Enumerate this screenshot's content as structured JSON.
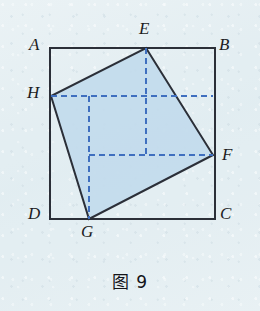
{
  "figure": {
    "caption": "图 9",
    "outer_square": {
      "name": "ABCD",
      "stroke_color": "#2b2f38",
      "stroke_width": 2,
      "vertices": [
        {
          "id": "A",
          "label": "A",
          "x": 50,
          "y": 48,
          "label_x": 29,
          "label_y": 36
        },
        {
          "id": "B",
          "label": "B",
          "x": 215,
          "y": 48,
          "label_x": 219,
          "label_y": 36
        },
        {
          "id": "C",
          "label": "C",
          "x": 215,
          "y": 219,
          "label_x": 220,
          "label_y": 205
        },
        {
          "id": "D",
          "label": "D",
          "x": 50,
          "y": 219,
          "label_x": 28,
          "label_y": 205
        }
      ]
    },
    "inner_square": {
      "name": "EFGH",
      "fill_color": "#c3dbec",
      "fill_opacity": 0.95,
      "stroke_color": "#2b2f38",
      "stroke_width": 2,
      "vertices": [
        {
          "id": "E",
          "label": "E",
          "x": 146,
          "y": 48,
          "label_x": 139,
          "label_y": 20,
          "on_edge": "AB"
        },
        {
          "id": "F",
          "label": "F",
          "x": 213,
          "y": 155,
          "label_x": 222,
          "label_y": 146,
          "on_edge": "BC"
        },
        {
          "id": "G",
          "label": "G",
          "x": 89,
          "y": 219,
          "label_x": 81,
          "label_y": 223,
          "on_edge": "DC"
        },
        {
          "id": "H",
          "label": "H",
          "x": 51,
          "y": 96,
          "label_x": 27,
          "label_y": 84,
          "on_edge": "AD"
        }
      ]
    },
    "dashed_guides": {
      "stroke_color": "#3f6fbf",
      "stroke_width": 2,
      "dash_pattern": "6 4",
      "segments": [
        {
          "name": "horizontal-through-H",
          "x1": 51,
          "y1": 96,
          "x2": 213,
          "y2": 96
        },
        {
          "name": "horizontal-through-F",
          "x1": 89,
          "y1": 155,
          "x2": 213,
          "y2": 155
        },
        {
          "name": "vertical-through-E",
          "x1": 146,
          "y1": 48,
          "x2": 146,
          "y2": 155
        },
        {
          "name": "vertical-through-G",
          "x1": 89,
          "y1": 96,
          "x2": 89,
          "y2": 219
        }
      ]
    },
    "colors": {
      "background": "#e3eef2",
      "inner_fill": "#c3dbec",
      "line_dark": "#2b2f38",
      "dashed_blue": "#3f6fbf",
      "label_text": "#1c1c22"
    }
  }
}
